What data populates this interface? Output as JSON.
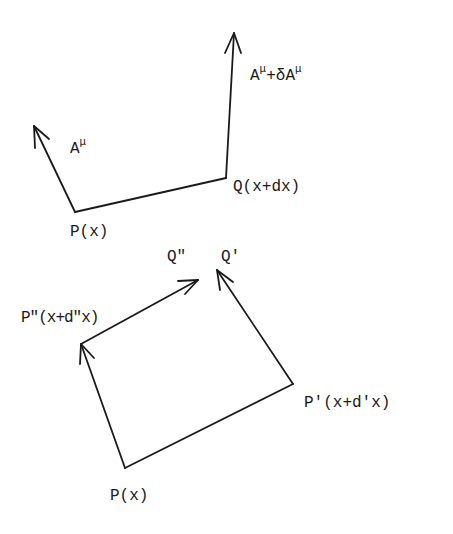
{
  "figure": {
    "top": {
      "labels": {
        "a_mu_base": "A",
        "a_mu_sup": "μ",
        "a_plus_base1": "A",
        "a_plus_sup1": "μ",
        "a_plus_mid": "+δA",
        "a_plus_sup2": "μ",
        "q": "Q(x+dx)",
        "p": "P(x)"
      }
    },
    "bottom": {
      "labels": {
        "q_double": "Q\"",
        "q_prime": "Q'",
        "p_double": "P\"(x+d\"x)",
        "p_prime": "P'(x+d'x)",
        "p": "P(x)"
      }
    },
    "colors": {
      "stroke": "#1a1a1a",
      "background": "#ffffff"
    }
  }
}
